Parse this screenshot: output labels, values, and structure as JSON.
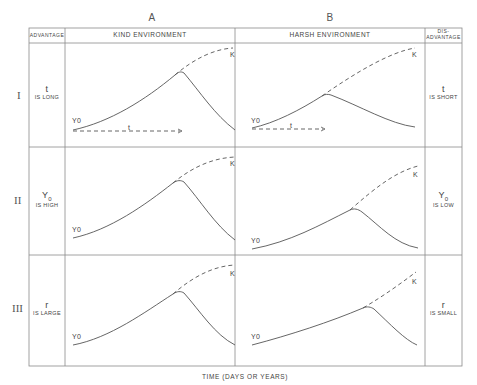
{
  "column_letters": {
    "a": "A",
    "b": "B"
  },
  "header": {
    "advantage": "ADVANTAGE",
    "kind": "KIND ENVIRONMENT",
    "harsh": "HARSH ENVIRONMENT",
    "disadvantage_line1": "DIS-",
    "disadvantage_line2": "ADVANTAGE"
  },
  "rows": [
    {
      "numeral": "I",
      "advantage_symbol": "t",
      "advantage_condition": "IS LONG",
      "disadvantage_symbol": "t",
      "disadvantage_condition": "IS SHORT"
    },
    {
      "numeral": "II",
      "advantage_symbol": "Y",
      "advantage_symbol_sub": "0",
      "advantage_condition": "IS HIGH",
      "disadvantage_symbol": "Y",
      "disadvantage_symbol_sub": "0",
      "disadvantage_condition": "IS LOW"
    },
    {
      "numeral": "III",
      "advantage_symbol": "r",
      "advantage_condition": "IS LARGE",
      "disadvantage_symbol": "r",
      "disadvantage_condition": "IS SMALL"
    }
  ],
  "curve_labels": {
    "start": "Y0",
    "capacity": "K",
    "time_arrow": "t"
  },
  "x_axis_label": "TIME (DAYS OR YEARS)",
  "colors": {
    "line": "#555555",
    "grid": "#888888"
  }
}
